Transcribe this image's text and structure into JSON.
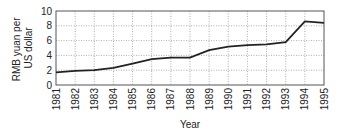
{
  "chart_data": {
    "type": "line",
    "title": "",
    "xlabel": "Year",
    "ylabel": "RMB yuan per US dollar",
    "ylabel_lines": [
      "RMB yuan per",
      "US dollar"
    ],
    "x": [
      "1981",
      "1982",
      "1983",
      "1984",
      "1985",
      "1986",
      "1987",
      "1988",
      "1989",
      "1990",
      "1991",
      "1992",
      "1993",
      "1994",
      "1995"
    ],
    "series": [
      {
        "name": "RMB yuan per US dollar",
        "values": [
          1.7,
          1.9,
          2.0,
          2.3,
          2.9,
          3.5,
          3.7,
          3.7,
          4.7,
          5.2,
          5.4,
          5.5,
          5.8,
          8.6,
          8.4
        ]
      }
    ],
    "yticks": [
      "0",
      "2",
      "4",
      "6",
      "8",
      "10"
    ],
    "ylim": [
      0,
      10
    ],
    "grid": true,
    "legend": "none"
  }
}
